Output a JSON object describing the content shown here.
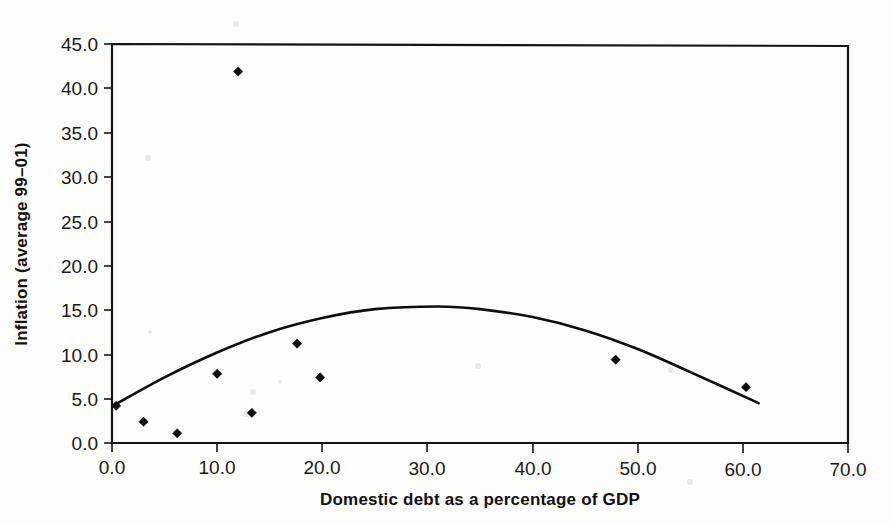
{
  "chart_data": {
    "type": "scatter",
    "title": "",
    "xlabel": "Domestic debt as a percentage of GDP",
    "ylabel": "Inflation (average 99–01)",
    "xlim": [
      0,
      70
    ],
    "ylim": [
      0,
      45
    ],
    "grid": false,
    "legend": null,
    "xticks": [
      "0.0",
      "10.0",
      "20.0",
      "30.0",
      "40.0",
      "50.0",
      "60.0",
      "70.0"
    ],
    "xtick_values": [
      0,
      10,
      20,
      30,
      40,
      50,
      60,
      70
    ],
    "yticks": [
      "0.0",
      "5.0",
      "10.0",
      "15.0",
      "20.0",
      "25.0",
      "30.0",
      "35.0",
      "40.0",
      "45.0"
    ],
    "ytick_values": [
      0,
      5,
      10,
      15,
      20,
      25,
      30,
      35,
      40,
      45
    ],
    "series": [
      {
        "name": "countries",
        "type": "scatter",
        "marker": "diamond",
        "color": "#0a0a0a",
        "points": [
          {
            "x": 0.4,
            "y": 4.2
          },
          {
            "x": 3.0,
            "y": 2.4
          },
          {
            "x": 6.2,
            "y": 1.1
          },
          {
            "x": 10.0,
            "y": 7.8
          },
          {
            "x": 12.0,
            "y": 41.9
          },
          {
            "x": 13.3,
            "y": 3.4
          },
          {
            "x": 17.6,
            "y": 11.2
          },
          {
            "x": 19.8,
            "y": 7.4
          },
          {
            "x": 47.9,
            "y": 9.4
          },
          {
            "x": 60.3,
            "y": 6.3
          }
        ]
      },
      {
        "name": "fitted quadratic trend",
        "type": "line",
        "color": "#0d0d0d",
        "x_range": [
          0.1,
          61.5
        ],
        "vertex": {
          "x": 31.0,
          "y": 15.4
        },
        "points": [
          {
            "x": 0.1,
            "y": 4.2
          },
          {
            "x": 5.0,
            "y": 7.4
          },
          {
            "x": 10.0,
            "y": 10.2
          },
          {
            "x": 15.0,
            "y": 12.5
          },
          {
            "x": 20.0,
            "y": 14.1
          },
          {
            "x": 25.0,
            "y": 15.1
          },
          {
            "x": 31.0,
            "y": 15.4
          },
          {
            "x": 35.0,
            "y": 15.1
          },
          {
            "x": 40.0,
            "y": 14.2
          },
          {
            "x": 45.0,
            "y": 12.7
          },
          {
            "x": 50.0,
            "y": 10.6
          },
          {
            "x": 55.0,
            "y": 8.0
          },
          {
            "x": 61.5,
            "y": 4.5
          }
        ]
      }
    ]
  },
  "figure": {
    "background_color": "#fdfdfb",
    "axis_color": "#141414"
  }
}
